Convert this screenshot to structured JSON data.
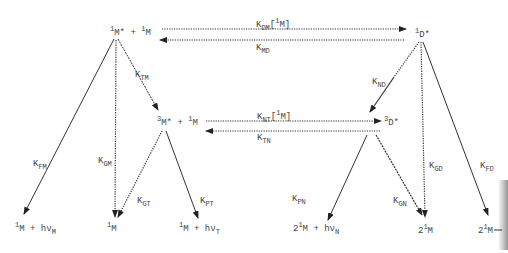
{
  "diagram": {
    "species": {
      "excited_monomer_pair": {
        "main": "M*",
        "pre": "1",
        "plus": "+",
        "partner_pre": "1",
        "partner": "M"
      },
      "singlet_dimer": {
        "pre": "1",
        "main": "D*"
      },
      "triplet_monomer_pair": {
        "pre": "3",
        "main": "M*",
        "plus": "+",
        "partner_pre": "1",
        "partner": "M"
      },
      "triplet_dimer": {
        "pre": "3",
        "main": "D*"
      },
      "ground_plus_photon_M": {
        "pre": "1",
        "main": "M",
        "plus": "+ hν",
        "sub": "M"
      },
      "ground_M_from_GM": {
        "pre": "1",
        "main": "M"
      },
      "ground_plus_photon_T": {
        "pre": "1",
        "main": "M",
        "plus": "+ hν",
        "sub": "T"
      },
      "two_M_plus_photon_N": {
        "coef": "2",
        "pre": "1",
        "main": "M",
        "plus": "+ hν",
        "sub": "N"
      },
      "two_M_from_GD": {
        "coef": "2",
        "pre": "1",
        "main": "M"
      },
      "two_M_from_FD": {
        "coef": "2",
        "pre": "1",
        "main": "M"
      }
    },
    "rates": {
      "DM": {
        "k": "K",
        "sub": "DM",
        "suffix_open": "[",
        "suffix_pre": "1",
        "suffix_main": "M]"
      },
      "MD": {
        "k": "K",
        "sub": "MD"
      },
      "TM": {
        "k": "K",
        "sub": "TM"
      },
      "FM": {
        "k": "K",
        "sub": "FM"
      },
      "GM": {
        "k": "K",
        "sub": "GM"
      },
      "GT": {
        "k": "K",
        "sub": "GT"
      },
      "PT": {
        "k": "K",
        "sub": "PT"
      },
      "NT": {
        "k": "K",
        "sub": "NT",
        "suffix_open": "[",
        "suffix_pre": "1",
        "suffix_main": "M]"
      },
      "TN": {
        "k": "K",
        "sub": "TN"
      },
      "ND": {
        "k": "K",
        "sub": "ND"
      },
      "PN": {
        "k": "K",
        "sub": "PN"
      },
      "GN": {
        "k": "K",
        "sub": "GN"
      },
      "GD": {
        "k": "K",
        "sub": "GD"
      },
      "FD": {
        "k": "K",
        "sub": "FD"
      }
    },
    "colors": {
      "ink": "#333333",
      "background": "#ffffff"
    }
  }
}
